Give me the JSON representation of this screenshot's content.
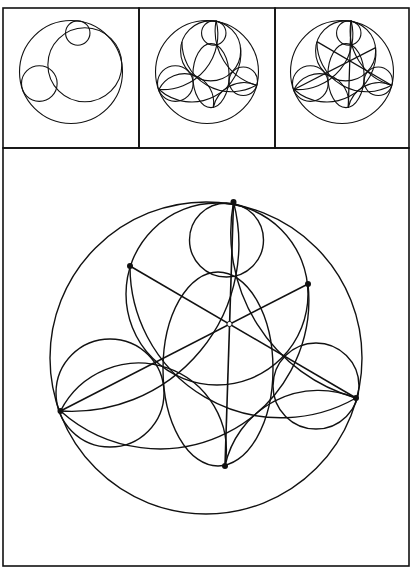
{
  "figure": {
    "stroke_color": "#111111",
    "background": "#ffffff",
    "frame": {
      "x": 3,
      "y": 8,
      "w": 406,
      "h": 558
    },
    "panels": [
      {
        "name": "step-1",
        "x": 3,
        "y": 8,
        "w": 136,
        "h": 140
      },
      {
        "name": "step-2",
        "x": 139,
        "y": 8,
        "w": 136,
        "h": 140
      },
      {
        "name": "step-3",
        "x": 275,
        "y": 8,
        "w": 134,
        "h": 140
      },
      {
        "name": "final",
        "x": 3,
        "y": 148,
        "w": 406,
        "h": 418
      }
    ],
    "main": {
      "outer_circle": {
        "cx": 206,
        "cy": 358,
        "r": 156
      },
      "top_circle": {
        "cx": 226.5,
        "cy": 240,
        "r": 37
      },
      "left_circle": {
        "cx": 110,
        "cy": 393,
        "r": 54
      },
      "right_circle": {
        "cx": 316,
        "cy": 386,
        "r": 43
      },
      "upper_circle": {
        "cx": 217,
        "cy": 294,
        "r": 91
      },
      "lower_ellipse": {
        "cx": 218,
        "cy": 369,
        "rx": 55,
        "ry": 97
      },
      "points": {
        "top": [
          233.5,
          202
        ],
        "upper_left": [
          130,
          266
        ],
        "upper_right": [
          308,
          284
        ],
        "left": [
          60.5,
          411
        ],
        "right": [
          356,
          398
        ],
        "bottom": [
          225,
          466
        ],
        "center": [
          229.5,
          324
        ]
      }
    }
  }
}
